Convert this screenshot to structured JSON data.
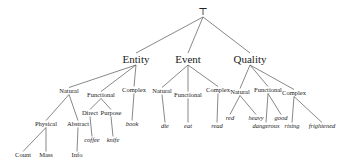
{
  "diagram": {
    "type": "tree",
    "root": {
      "id": "root",
      "label": "⊤",
      "x": 203,
      "y": 12
    },
    "nodes": [
      {
        "id": "entity",
        "label": "Entity",
        "x": 136,
        "y": 59,
        "kind": "cat-top",
        "parent": "root"
      },
      {
        "id": "event",
        "label": "Event",
        "x": 188,
        "y": 59,
        "kind": "cat-top",
        "parent": "root"
      },
      {
        "id": "quality",
        "label": "Quality",
        "x": 250,
        "y": 59,
        "kind": "cat-top",
        "parent": "root"
      },
      {
        "id": "ent-natural",
        "label": "Natural",
        "x": 69,
        "y": 91,
        "kind": "cat",
        "parent": "entity"
      },
      {
        "id": "ent-functional",
        "label": "Functional",
        "x": 101,
        "y": 95,
        "kind": "cat",
        "parent": "entity"
      },
      {
        "id": "ent-complex",
        "label": "Complex",
        "x": 134,
        "y": 90,
        "kind": "cat",
        "parent": "entity"
      },
      {
        "id": "physical",
        "label": "Physical",
        "x": 46,
        "y": 124,
        "kind": "cat",
        "parent": "ent-natural"
      },
      {
        "id": "abstract",
        "label": "Abstract",
        "x": 78,
        "y": 124,
        "kind": "cat",
        "parent": "ent-natural"
      },
      {
        "id": "count",
        "label": "Count",
        "x": 23,
        "y": 155,
        "kind": "cat",
        "parent": "physical"
      },
      {
        "id": "mass",
        "label": "Mass",
        "x": 46,
        "y": 155,
        "kind": "cat",
        "parent": "physical"
      },
      {
        "id": "info",
        "label": "Info",
        "x": 77,
        "y": 155,
        "kind": "cat",
        "parent": "abstract"
      },
      {
        "id": "direct",
        "label": "Direct",
        "x": 90,
        "y": 113,
        "kind": "cat",
        "parent": "ent-functional"
      },
      {
        "id": "purpose",
        "label": "Purpose",
        "x": 111,
        "y": 113,
        "kind": "cat",
        "parent": "ent-functional"
      },
      {
        "id": "coffee",
        "label": "coffee",
        "x": 92,
        "y": 140,
        "kind": "leaf",
        "parent": "direct"
      },
      {
        "id": "knife",
        "label": "knife",
        "x": 113,
        "y": 140,
        "kind": "leaf",
        "parent": "purpose"
      },
      {
        "id": "book",
        "label": "book",
        "x": 132,
        "y": 124,
        "kind": "leaf",
        "parent": "ent-complex"
      },
      {
        "id": "ev-natural",
        "label": "Natural",
        "x": 162,
        "y": 91,
        "kind": "cat",
        "parent": "event"
      },
      {
        "id": "ev-functional",
        "label": "Functional",
        "x": 188,
        "y": 95,
        "kind": "cat",
        "parent": "event"
      },
      {
        "id": "ev-complex",
        "label": "Complex",
        "x": 218,
        "y": 90,
        "kind": "cat",
        "parent": "event"
      },
      {
        "id": "die",
        "label": "die",
        "x": 165,
        "y": 126,
        "kind": "leaf",
        "parent": "ev-natural"
      },
      {
        "id": "eat",
        "label": "eat",
        "x": 188,
        "y": 126,
        "kind": "leaf",
        "parent": "ev-functional"
      },
      {
        "id": "read",
        "label": "read",
        "x": 217,
        "y": 126,
        "kind": "leaf",
        "parent": "ev-complex"
      },
      {
        "id": "q-natural",
        "label": "Natural",
        "x": 240,
        "y": 92,
        "kind": "cat",
        "parent": "quality"
      },
      {
        "id": "q-functional",
        "label": "Functional",
        "x": 268,
        "y": 90,
        "kind": "cat",
        "parent": "quality"
      },
      {
        "id": "q-complex",
        "label": "Complex",
        "x": 294,
        "y": 93,
        "kind": "cat",
        "parent": "quality"
      },
      {
        "id": "red",
        "label": "red",
        "x": 230,
        "y": 118,
        "kind": "leaf",
        "parent": "q-natural"
      },
      {
        "id": "heavy",
        "label": "heavy",
        "x": 256,
        "y": 118,
        "kind": "leaf",
        "parent": "q-natural"
      },
      {
        "id": "dangerous",
        "label": "dangerous",
        "x": 266,
        "y": 126,
        "kind": "leaf",
        "parent": "q-functional"
      },
      {
        "id": "good",
        "label": "good",
        "x": 281,
        "y": 118,
        "kind": "leaf",
        "parent": "q-functional"
      },
      {
        "id": "rising",
        "label": "rising",
        "x": 292,
        "y": 126,
        "kind": "leaf",
        "parent": "q-complex"
      },
      {
        "id": "frightened",
        "label": "frightened",
        "x": 322,
        "y": 126,
        "kind": "leaf",
        "parent": "q-complex"
      }
    ]
  }
}
